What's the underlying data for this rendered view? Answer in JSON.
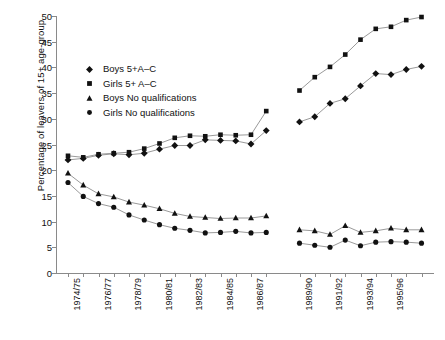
{
  "chart_data": {
    "type": "line",
    "title": "",
    "xlabel": "",
    "ylabel": "Percentage of leavers of 15+ age-group",
    "ylim": [
      0,
      50
    ],
    "yticks": [
      0,
      5,
      10,
      15,
      20,
      25,
      30,
      35,
      40,
      45,
      50
    ],
    "grid": false,
    "legend_position": "upper-left",
    "marker_color": "#111111",
    "line_color": "#9a9a9a",
    "axis_color": "#8a8a8a",
    "note": "Series are broken into two blocks separated by a gap on the x-axis",
    "categories": [
      "1974/75",
      "1975/76",
      "1976/77",
      "1977/78",
      "1978/79",
      "1979/80",
      "1980/81",
      "1981/82",
      "1982/83",
      "1983/84",
      "1984/85",
      "1985/86",
      "1986/87",
      "1987/88",
      "1989/90",
      "1990/91",
      "1991/92",
      "1992/93",
      "1993/94",
      "1994/95",
      "1995/96",
      "1996/97",
      "1997/98"
    ],
    "tick_labels": [
      "1974/75",
      "",
      "1976/77",
      "",
      "1978/79",
      "",
      "1980/81",
      "",
      "1982/83",
      "",
      "1984/85",
      "",
      "1986/87",
      "",
      "1989/90",
      "",
      "1991/92",
      "",
      "1993/94",
      "",
      "1995/96",
      "",
      ""
    ],
    "break_after_index": 13,
    "series": [
      {
        "name": "Boys 5+A–C",
        "marker": "diamond",
        "values": [
          22.0,
          22.3,
          22.9,
          23.2,
          23.0,
          23.3,
          24.1,
          24.8,
          24.8,
          25.9,
          25.8,
          25.7,
          25.1,
          27.7,
          29.4,
          30.4,
          33.0,
          33.9,
          36.4,
          38.8,
          38.6,
          39.6,
          40.2
        ]
      },
      {
        "name": "Girls 5+ A–C",
        "marker": "square",
        "values": [
          22.8,
          22.5,
          23.1,
          23.3,
          23.5,
          24.2,
          25.2,
          26.3,
          26.7,
          26.6,
          26.9,
          26.8,
          26.9,
          31.5,
          35.5,
          38.1,
          40.1,
          42.5,
          45.4,
          47.5,
          47.9,
          49.2,
          49.8
        ]
      },
      {
        "name": "Boys No qualifications",
        "marker": "triangle",
        "values": [
          19.4,
          17.1,
          15.4,
          14.8,
          13.8,
          13.2,
          12.5,
          11.6,
          11.0,
          10.8,
          10.6,
          10.7,
          10.7,
          11.1,
          8.4,
          8.2,
          7.5,
          9.2,
          7.9,
          8.2,
          8.7,
          8.4,
          8.4
        ]
      },
      {
        "name": "Girls No qualifications",
        "marker": "circle",
        "values": [
          17.6,
          14.9,
          13.5,
          12.8,
          11.3,
          10.3,
          9.4,
          8.7,
          8.3,
          7.8,
          7.9,
          8.1,
          7.8,
          7.9,
          5.8,
          5.4,
          5.0,
          6.4,
          5.3,
          6.0,
          6.1,
          6.0,
          5.8
        ]
      }
    ]
  },
  "legend": {
    "items": [
      {
        "label": "Boys 5+A–C",
        "marker": "diamond"
      },
      {
        "label": "Girls 5+ A–C",
        "marker": "square"
      },
      {
        "label": "Boys No qualifications",
        "marker": "triangle"
      },
      {
        "label": "Girls No qualifications",
        "marker": "circle"
      }
    ]
  }
}
